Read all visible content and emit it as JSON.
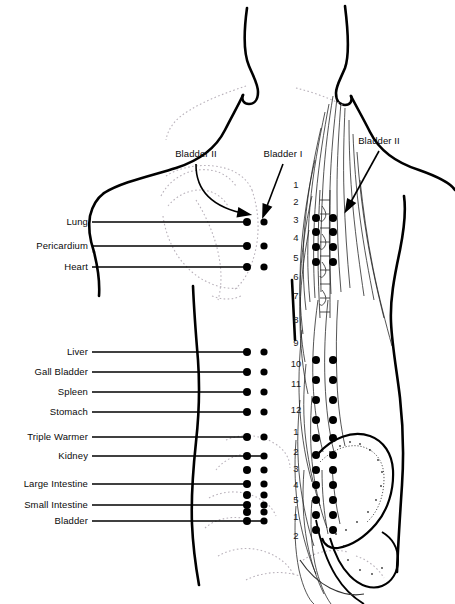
{
  "figure": {
    "view": "posterior (back) of human torso",
    "ink_color": "#000000",
    "background_color": "#ffffff",
    "faint_outline_color": "#b9b2bb"
  },
  "arrow_labels": [
    {
      "id": "bladder-2-left",
      "text": "Bladder II",
      "x": 196,
      "y": 154,
      "tip_x": 247,
      "tip_y": 221
    },
    {
      "id": "bladder-1",
      "text": "Bladder I",
      "x": 283,
      "y": 154,
      "tip_x": 264,
      "tip_y": 221
    },
    {
      "id": "bladder-2-right",
      "text": "Bladder II",
      "x": 379,
      "y": 141,
      "tip_x": 347,
      "tip_y": 216
    }
  ],
  "organ_labels": [
    {
      "text": "Lung",
      "y": 222,
      "line_to": 247
    },
    {
      "text": "Pericardium",
      "y": 246,
      "line_to": 247
    },
    {
      "text": "Heart",
      "y": 267,
      "line_to": 247
    },
    {
      "text": "Liver",
      "y": 352,
      "line_to": 247
    },
    {
      "text": "Gall Bladder",
      "y": 372,
      "line_to": 247
    },
    {
      "text": "Spleen",
      "y": 392,
      "line_to": 247
    },
    {
      "text": "Stomach",
      "y": 412,
      "line_to": 247
    },
    {
      "text": "Triple Warmer",
      "y": 437,
      "line_to": 247
    },
    {
      "text": "Kidney",
      "y": 456,
      "line_to": 264
    },
    {
      "text": "Large Intestine",
      "y": 484,
      "line_to": 247
    },
    {
      "text": "Small Intestine",
      "y": 505,
      "line_to": 247
    },
    {
      "text": "Bladder",
      "y": 521,
      "line_to": 264
    }
  ],
  "label_right_edge": 88,
  "vertebrae_numbers": [
    {
      "label": "1",
      "y": 185
    },
    {
      "label": "2",
      "y": 202
    },
    {
      "label": "3",
      "y": 220
    },
    {
      "label": "4",
      "y": 238
    },
    {
      "label": "5",
      "y": 258
    },
    {
      "label": "6",
      "y": 277
    },
    {
      "label": "7",
      "y": 296
    },
    {
      "label": "8",
      "y": 320
    },
    {
      "label": "9",
      "y": 343
    },
    {
      "label": "10",
      "y": 364
    },
    {
      "label": "11",
      "y": 384
    },
    {
      "label": "12",
      "y": 410
    },
    {
      "label": "1",
      "y": 432
    },
    {
      "label": "2",
      "y": 452
    },
    {
      "label": "3",
      "y": 469
    },
    {
      "label": "4",
      "y": 485
    },
    {
      "label": "5",
      "y": 500
    },
    {
      "label": "1",
      "y": 517
    },
    {
      "label": "2",
      "y": 536
    }
  ],
  "vertebrae_number_x": 296,
  "point_columns": {
    "inner_x": 247,
    "outer_x": 264,
    "spine_inner_x": 316,
    "spine_outer_x": 333
  },
  "point_rows_upper": [
    222,
    246,
    267
  ],
  "point_rows_lower": [
    352,
    372,
    392,
    412,
    437,
    456,
    470,
    484,
    495,
    505,
    512,
    521
  ],
  "spine_point_rows": [
    218,
    232,
    247,
    262,
    360,
    380,
    400,
    420,
    438,
    455,
    470,
    485,
    500,
    515,
    530
  ],
  "dot_radius": 4
}
